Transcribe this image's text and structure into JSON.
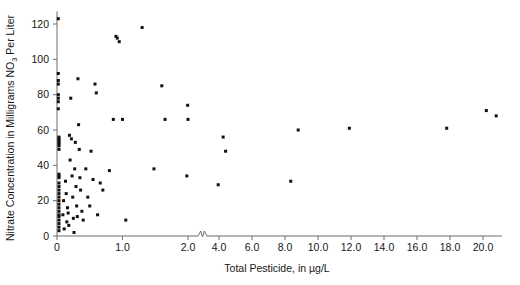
{
  "chart_data": {
    "type": "scatter",
    "title": "",
    "xlabel": "Total Pesticide, in µg/L",
    "ylabel": "Nitrate Concentration in Milligrams NO3 Per Liter",
    "ylabel_parts": {
      "before": "Nitrate Concentration in Milligrams NO",
      "subscript": "3",
      "after": " Per Liter"
    },
    "xlabel_parts": {
      "before": "Total Pesticide, in ",
      "mu": "µ",
      "after": "g/L"
    },
    "xlim": [
      0,
      21.2
    ],
    "ylim": [
      0,
      126
    ],
    "grid": false,
    "legend": null,
    "axis_break": {
      "present": true,
      "axis": "x",
      "between": [
        2.0,
        4.0
      ],
      "symbol": "zigzag"
    },
    "xticks": [
      0,
      1.0,
      2.0,
      4.0,
      6.0,
      8.0,
      10.0,
      12.0,
      14.0,
      16.0,
      18.0,
      20.0
    ],
    "xtick_labels": [
      "0",
      "1.0",
      "2.0",
      "4.0",
      "6.0",
      "8.0",
      "10.0",
      "12.0",
      "14.0",
      "16.0",
      "18.0",
      "20.0"
    ],
    "yticks": [
      0,
      20,
      40,
      60,
      80,
      100,
      120
    ],
    "ytick_labels": [
      "0",
      "20",
      "40",
      "60",
      "80",
      "100",
      "120"
    ],
    "marker": {
      "shape": "square",
      "color": "#111111",
      "size_px": 3
    },
    "series": [
      {
        "name": "Samples",
        "points": [
          [
            0.02,
            123
          ],
          [
            0.02,
            92
          ],
          [
            0.02,
            88
          ],
          [
            0.02,
            86
          ],
          [
            0.02,
            80
          ],
          [
            0.02,
            78
          ],
          [
            0.02,
            76
          ],
          [
            0.02,
            72
          ],
          [
            0.03,
            56
          ],
          [
            0.03,
            55
          ],
          [
            0.03,
            54
          ],
          [
            0.03,
            53
          ],
          [
            0.03,
            52
          ],
          [
            0.03,
            51
          ],
          [
            0.03,
            49
          ],
          [
            0.03,
            35
          ],
          [
            0.03,
            34
          ],
          [
            0.03,
            33
          ],
          [
            0.03,
            30
          ],
          [
            0.03,
            28
          ],
          [
            0.03,
            26
          ],
          [
            0.03,
            24
          ],
          [
            0.03,
            22
          ],
          [
            0.03,
            20
          ],
          [
            0.03,
            18
          ],
          [
            0.03,
            16
          ],
          [
            0.03,
            14
          ],
          [
            0.03,
            12
          ],
          [
            0.03,
            11
          ],
          [
            0.03,
            9
          ],
          [
            0.03,
            7
          ],
          [
            0.03,
            5
          ],
          [
            0.03,
            3
          ],
          [
            0.09,
            12
          ],
          [
            0.1,
            20
          ],
          [
            0.11,
            4
          ],
          [
            0.13,
            31
          ],
          [
            0.14,
            24
          ],
          [
            0.15,
            8
          ],
          [
            0.16,
            16
          ],
          [
            0.17,
            13
          ],
          [
            0.18,
            6
          ],
          [
            0.19,
            57
          ],
          [
            0.2,
            43
          ],
          [
            0.21,
            78
          ],
          [
            0.22,
            55
          ],
          [
            0.23,
            34
          ],
          [
            0.24,
            22
          ],
          [
            0.25,
            10
          ],
          [
            0.26,
            2
          ],
          [
            0.27,
            38
          ],
          [
            0.28,
            53
          ],
          [
            0.29,
            28
          ],
          [
            0.3,
            17
          ],
          [
            0.31,
            11
          ],
          [
            0.32,
            89
          ],
          [
            0.33,
            63
          ],
          [
            0.34,
            49
          ],
          [
            0.35,
            33
          ],
          [
            0.36,
            26
          ],
          [
            0.38,
            14
          ],
          [
            0.4,
            9
          ],
          [
            0.44,
            38
          ],
          [
            0.47,
            22
          ],
          [
            0.5,
            17
          ],
          [
            0.52,
            48
          ],
          [
            0.55,
            32
          ],
          [
            0.58,
            86
          ],
          [
            0.6,
            81
          ],
          [
            0.62,
            12
          ],
          [
            0.66,
            30
          ],
          [
            0.7,
            26
          ],
          [
            0.8,
            37
          ],
          [
            0.86,
            66
          ],
          [
            0.9,
            113
          ],
          [
            0.92,
            112
          ],
          [
            0.95,
            110
          ],
          [
            1.0,
            66
          ],
          [
            1.05,
            9
          ],
          [
            1.3,
            118
          ],
          [
            1.48,
            38
          ],
          [
            1.6,
            85
          ],
          [
            1.65,
            66
          ],
          [
            2.05,
            34
          ],
          [
            2.1,
            74
          ],
          [
            2.12,
            66
          ],
          [
            3.95,
            29
          ],
          [
            4.25,
            56
          ],
          [
            4.4,
            48
          ],
          [
            8.35,
            31
          ],
          [
            8.8,
            60
          ],
          [
            11.9,
            61
          ],
          [
            17.8,
            61
          ],
          [
            20.2,
            71
          ],
          [
            20.8,
            68
          ]
        ]
      }
    ]
  }
}
